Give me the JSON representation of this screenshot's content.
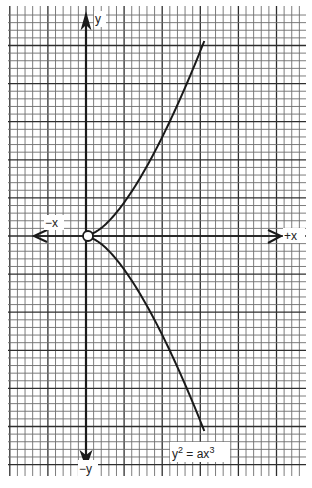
{
  "figure": {
    "equation_label": "y² = ax³",
    "equation": {
      "base": "y",
      "exp_y": "2",
      "mid": " = ax",
      "exp_x": "3"
    },
    "axes": {
      "x_positive_label": "+x",
      "x_negative_label": "−x",
      "y_positive_label": "y",
      "y_negative_label": "−y"
    },
    "grid": {
      "minor_per_major": 5,
      "style": "graph-paper"
    },
    "curve": {
      "type": "semicubical parabola",
      "parameter_a": 1,
      "x_range_cells": [
        0,
        15
      ],
      "branches": [
        "upper",
        "lower"
      ],
      "cusp_at_origin": true
    },
    "colors": {
      "ink": "#1a1a1a",
      "grid_minor": "#6e6e6e",
      "grid_major": "#2e2e2e",
      "paper": "#ffffff"
    }
  }
}
